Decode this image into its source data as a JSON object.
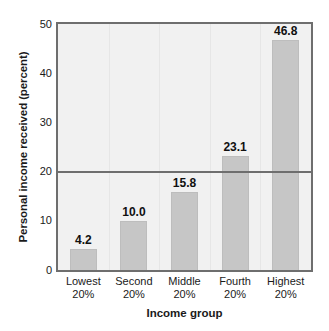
{
  "chart_data": {
    "type": "bar",
    "title": "",
    "subtitle": "",
    "xlabel": "Income group",
    "ylabel": "Personal income received (percent)",
    "categories": [
      "Lowest\n20%",
      "Second\n20%",
      "Middle\n20%",
      "Fourth\n20%",
      "Highest\n20%"
    ],
    "category_lines": [
      {
        "line1": "Lowest",
        "line2": "20%"
      },
      {
        "line1": "Second",
        "line2": "20%"
      },
      {
        "line1": "Middle",
        "line2": "20%"
      },
      {
        "line1": "Fourth",
        "line2": "20%"
      },
      {
        "line1": "Highest",
        "line2": "20%"
      }
    ],
    "values": [
      4.2,
      10.0,
      15.8,
      23.1,
      46.8
    ],
    "value_labels": [
      "4.2",
      "10.0",
      "15.8",
      "23.1",
      "46.8"
    ],
    "ylim": [
      0,
      50
    ],
    "yticks": [
      0,
      10,
      20,
      30,
      40,
      50
    ],
    "ytick_labels": [
      "0",
      "10",
      "20",
      "30",
      "40",
      "50"
    ],
    "grid": false,
    "legend": null,
    "annotations": [
      {
        "type": "hline",
        "y": 20,
        "label": ""
      }
    ],
    "colors": {
      "bar_fill": "#c6c6c6",
      "bar_edge": "#bdbdbd",
      "plot_background": "#f1f1f1",
      "axis_frame": "#6e6e6e",
      "reference_line": "#6e6e6e",
      "text": "#1a1a1a",
      "figure_background": "#ffffff"
    }
  }
}
